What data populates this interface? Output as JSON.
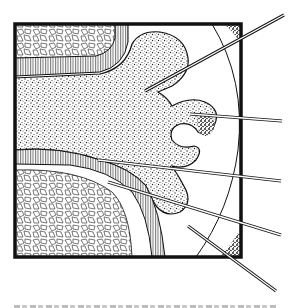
{
  "figure": {
    "type": "line-art anatomical illustration",
    "frame": {
      "x": 15,
      "y": 24,
      "width": 226,
      "height": 233
    },
    "colors": {
      "ink": "#111111",
      "paper": "#ffffff",
      "caption_gray": "#c0c0c0"
    },
    "leader_lines": [
      {
        "id": 1,
        "from": [
          145,
          92
        ],
        "to": [
          284,
          16
        ]
      },
      {
        "id": 2,
        "from": [
          190,
          114
        ],
        "to": [
          282,
          121
        ]
      },
      {
        "id": 3,
        "from": [
          100,
          160
        ],
        "to": [
          281,
          180
        ]
      },
      {
        "id": 4,
        "from": [
          110,
          183
        ],
        "to": [
          281,
          234
        ]
      },
      {
        "id": 5,
        "from": [
          188,
          227
        ],
        "to": [
          275,
          290
        ]
      }
    ],
    "caption": {
      "visible": false,
      "note": "caption line cut off at bottom edge"
    }
  }
}
